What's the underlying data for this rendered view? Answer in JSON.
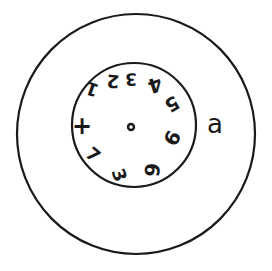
{
  "figure": {
    "panel_label": "a",
    "background_color": "#ffffff",
    "ink_color": "#1a1a1a",
    "canvas": {
      "width": 272,
      "height": 271
    }
  },
  "outer_circle": {
    "name": "outer-circle",
    "center_x": 136,
    "center_y": 134,
    "radius": 119,
    "stroke_width": 2.2
  },
  "inner_circle": {
    "name": "inner-circle",
    "center_x": 134,
    "center_y": 125,
    "radius": 62,
    "stroke_width": 2.2
  },
  "center_dot": {
    "name": "center-dot",
    "center_x": 131,
    "center_y": 127,
    "outer_radius": 4.2,
    "inner_radius": 1.7
  },
  "clock_numbers": [
    {
      "label": "1",
      "x": 92,
      "y": 89,
      "size": 18,
      "rotate": 200
    },
    {
      "label": "2",
      "x": 113,
      "y": 81,
      "size": 18,
      "rotate": 185
    },
    {
      "label": "3",
      "x": 131,
      "y": 79,
      "size": 17,
      "rotate": 178
    },
    {
      "label": "4",
      "x": 155,
      "y": 85,
      "size": 20,
      "rotate": 162
    },
    {
      "label": "5",
      "x": 172,
      "y": 104,
      "size": 19,
      "rotate": 150
    },
    {
      "label": "9",
      "x": 172,
      "y": 138,
      "size": 20,
      "rotate": 118
    },
    {
      "label": "6",
      "x": 152,
      "y": 170,
      "size": 20,
      "rotate": 96
    },
    {
      "label": "3",
      "x": 119,
      "y": 175,
      "size": 18,
      "rotate": 70
    },
    {
      "label": "7",
      "x": 93,
      "y": 155,
      "size": 18,
      "rotate": 40
    },
    {
      "label": "+",
      "x": 82,
      "y": 126,
      "size": 24,
      "rotate": 0
    }
  ],
  "description": {
    "figure_type": "clock-drawing-test",
    "outer_shape": "circle",
    "inner_shape": "circle",
    "numbers_count": 10,
    "has_center_dot": true,
    "has_clock_hands": false
  }
}
